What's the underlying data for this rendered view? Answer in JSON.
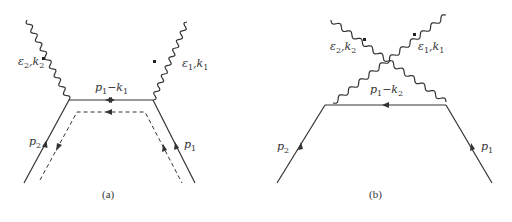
{
  "diagrams": [
    {
      "id": "a",
      "caption": "(a)",
      "labels": {
        "photon_left": {
          "sym": "ε",
          "s1": "2",
          "mid": ",k",
          "s2": "2"
        },
        "photon_right": {
          "sym": "ε",
          "s1": "1",
          "mid": ",k",
          "s2": "1"
        },
        "propagator": {
          "sym": "p",
          "s1": "1",
          "mid": "−k",
          "s2": "1"
        },
        "fermion_left": {
          "sym": "p",
          "s1": "2"
        },
        "fermion_right": {
          "sym": "p",
          "s1": "1"
        }
      }
    },
    {
      "id": "b",
      "caption": "(b)",
      "labels": {
        "photon_left": {
          "sym": "ε",
          "s1": "2",
          "mid": ",k",
          "s2": "2"
        },
        "photon_right": {
          "sym": "ε",
          "s1": "1",
          "mid": ",k",
          "s2": "1"
        },
        "propagator": {
          "sym": "p",
          "s1": "1",
          "mid": "−k",
          "s2": "2"
        },
        "fermion_left": {
          "sym": "p",
          "s1": "2"
        },
        "fermion_right": {
          "sym": "p",
          "s1": "1"
        }
      }
    }
  ],
  "colors": {
    "line": "#333333",
    "background": "#ffffff"
  }
}
